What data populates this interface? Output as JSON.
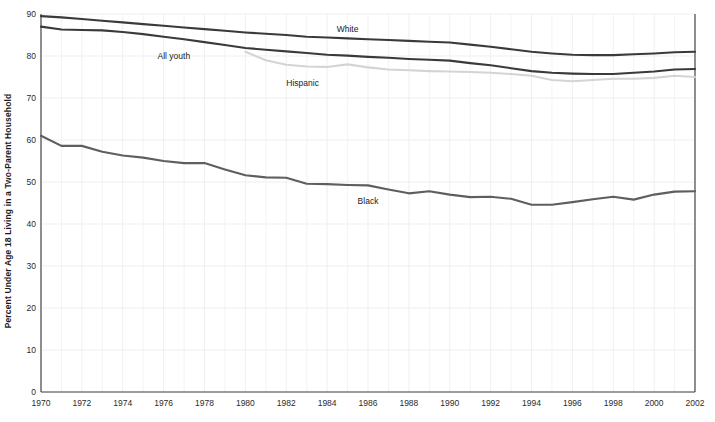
{
  "chart_data": {
    "type": "line",
    "title": "",
    "xlabel": "",
    "ylabel": "Percent Under Age 18 Living in a Two-Parent Household",
    "xlim": [
      1970,
      2002
    ],
    "ylim": [
      0,
      90
    ],
    "yticks": [
      0,
      10,
      20,
      30,
      40,
      50,
      60,
      70,
      80,
      90
    ],
    "ytick_labels": [
      "0",
      "10",
      "20",
      "30",
      "40",
      "50",
      "60",
      "70",
      "80",
      "90"
    ],
    "xticks": [
      1970,
      1972,
      1974,
      1976,
      1978,
      1980,
      1982,
      1984,
      1986,
      1988,
      1990,
      1992,
      1994,
      1996,
      1998,
      2000,
      2002
    ],
    "xtick_labels": [
      "1970",
      "1972",
      "1974",
      "1976",
      "1978",
      "1980",
      "1982",
      "1984",
      "1986",
      "1988",
      "1990",
      "1992",
      "1994",
      "1996",
      "1998",
      "2000",
      "2002"
    ],
    "grid": true,
    "grid_color": "#ededed",
    "legend": "inline-annotations",
    "series": [
      {
        "name": "White",
        "color": "#3a3a3a",
        "width": 2.1,
        "label_x": 1985.0,
        "label_y": 85.7,
        "x": [
          1970,
          1971,
          1972,
          1973,
          1974,
          1975,
          1976,
          1977,
          1978,
          1979,
          1980,
          1981,
          1982,
          1983,
          1984,
          1985,
          1986,
          1987,
          1988,
          1989,
          1990,
          1991,
          1992,
          1993,
          1994,
          1995,
          1996,
          1997,
          1998,
          1999,
          2000,
          2001,
          2002
        ],
        "values": [
          89.5,
          89.2,
          88.8,
          88.4,
          88.0,
          87.6,
          87.2,
          86.8,
          86.4,
          86.0,
          85.6,
          85.3,
          85.0,
          84.6,
          84.4,
          84.2,
          84.0,
          83.8,
          83.6,
          83.4,
          83.2,
          82.7,
          82.2,
          81.6,
          81.0,
          80.6,
          80.3,
          80.2,
          80.2,
          80.4,
          80.6,
          80.9,
          81.0
        ]
      },
      {
        "name": "All youth",
        "color": "#3a3a3a",
        "width": 2.1,
        "label_x": 1976.5,
        "label_y": 79.2,
        "x": [
          1970,
          1971,
          1972,
          1973,
          1974,
          1975,
          1976,
          1977,
          1978,
          1979,
          1980,
          1981,
          1982,
          1983,
          1984,
          1985,
          1986,
          1987,
          1988,
          1989,
          1990,
          1991,
          1992,
          1993,
          1994,
          1995,
          1996,
          1997,
          1998,
          1999,
          2000,
          2001,
          2002
        ],
        "values": [
          87.0,
          86.3,
          86.2,
          86.1,
          85.7,
          85.2,
          84.6,
          84.0,
          83.3,
          82.6,
          81.9,
          81.5,
          81.1,
          80.7,
          80.3,
          80.1,
          79.8,
          79.6,
          79.3,
          79.1,
          78.9,
          78.3,
          77.8,
          77.1,
          76.4,
          76.0,
          75.8,
          75.7,
          75.7,
          76.0,
          76.3,
          76.8,
          76.9
        ]
      },
      {
        "name": "Hispanic",
        "color": "#d4d4d4",
        "width": 2.1,
        "label_x": 1982.8,
        "label_y": 72.8,
        "x": [
          1980,
          1981,
          1982,
          1983,
          1984,
          1985,
          1986,
          1987,
          1988,
          1989,
          1990,
          1991,
          1992,
          1993,
          1994,
          1995,
          1996,
          1997,
          1998,
          1999,
          2000,
          2001,
          2002
        ],
        "values": [
          81.0,
          79.0,
          77.9,
          77.5,
          77.4,
          78.0,
          77.3,
          76.8,
          76.6,
          76.4,
          76.3,
          76.2,
          76.0,
          75.7,
          75.3,
          74.3,
          74.0,
          74.3,
          74.6,
          74.6,
          74.8,
          75.3,
          75.0
        ]
      },
      {
        "name": "Black",
        "color": "#5e5e5e",
        "width": 2.1,
        "label_x": 1986.0,
        "label_y": 44.8,
        "x": [
          1970,
          1971,
          1972,
          1973,
          1974,
          1975,
          1976,
          1977,
          1978,
          1979,
          1980,
          1981,
          1982,
          1983,
          1984,
          1985,
          1986,
          1987,
          1988,
          1989,
          1990,
          1991,
          1992,
          1993,
          1994,
          1995,
          1996,
          1997,
          1998,
          1999,
          2000,
          2001,
          2002
        ],
        "values": [
          61.0,
          58.6,
          58.6,
          57.2,
          56.3,
          55.8,
          55.0,
          54.5,
          54.5,
          53.0,
          51.6,
          51.1,
          51.0,
          49.6,
          49.5,
          49.3,
          49.2,
          48.2,
          47.3,
          47.8,
          47.0,
          46.4,
          46.5,
          46.0,
          44.6,
          44.6,
          45.2,
          45.9,
          46.5,
          45.8,
          47.0,
          47.7,
          47.8
        ]
      }
    ]
  },
  "annotations": {
    "white_label": "White",
    "allyouth_label": "All youth",
    "hispanic_label": "Hispanic",
    "black_label": "Black"
  }
}
